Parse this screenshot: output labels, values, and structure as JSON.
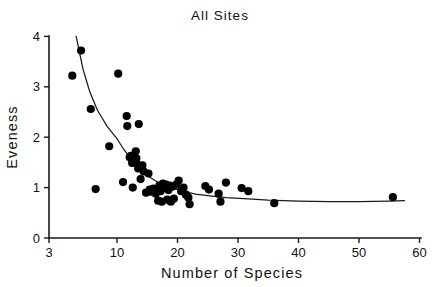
{
  "chart_data": {
    "type": "scatter",
    "title": "All  Sites",
    "xlabel": "Number  of  Species",
    "ylabel": "Eveness",
    "xlim": [
      3,
      60
    ],
    "ylim": [
      0,
      4
    ],
    "grid": false,
    "legend": null,
    "xticks": [
      3,
      10,
      20,
      30,
      40,
      50,
      60
    ],
    "xtick_labels": [
      "3",
      "10",
      "20",
      "30",
      "40",
      "50",
      "60"
    ],
    "yticks": [
      0,
      1,
      2,
      3,
      4
    ],
    "ytick_labels": [
      "0",
      "1",
      "2",
      "3",
      "4"
    ],
    "series": [
      {
        "name": "sites",
        "marker": "filled-circle",
        "color": "#000000",
        "points": [
          [
            5.4,
            3.22
          ],
          [
            6.3,
            3.72
          ],
          [
            7.3,
            2.56
          ],
          [
            7.8,
            0.97
          ],
          [
            9.2,
            1.82
          ],
          [
            10.2,
            3.26
          ],
          [
            11.0,
            1.11
          ],
          [
            11.6,
            2.42
          ],
          [
            11.7,
            2.22
          ],
          [
            12.1,
            1.6
          ],
          [
            12.3,
            1.63
          ],
          [
            12.5,
            1.49
          ],
          [
            12.6,
            1.0
          ],
          [
            12.9,
            1.55
          ],
          [
            13.1,
            1.72
          ],
          [
            13.2,
            1.58
          ],
          [
            13.3,
            1.47
          ],
          [
            13.5,
            1.38
          ],
          [
            13.6,
            2.26
          ],
          [
            13.9,
            1.17
          ],
          [
            14.2,
            1.44
          ],
          [
            14.4,
            1.32
          ],
          [
            14.8,
            0.9
          ],
          [
            15.2,
            1.28
          ],
          [
            15.4,
            0.96
          ],
          [
            15.6,
            0.92
          ],
          [
            16.0,
            0.98
          ],
          [
            16.4,
            0.88
          ],
          [
            16.8,
            0.74
          ],
          [
            17.0,
            1.04
          ],
          [
            17.2,
            0.93
          ],
          [
            17.4,
            0.72
          ],
          [
            17.6,
            1.08
          ],
          [
            17.9,
            1.0
          ],
          [
            18.1,
            1.06
          ],
          [
            18.3,
            0.76
          ],
          [
            18.5,
            0.95
          ],
          [
            18.7,
            1.04
          ],
          [
            18.9,
            0.72
          ],
          [
            19.2,
            1.02
          ],
          [
            19.4,
            0.78
          ],
          [
            19.8,
            1.06
          ],
          [
            20.2,
            1.14
          ],
          [
            20.6,
            0.93
          ],
          [
            21.0,
            1.0
          ],
          [
            21.4,
            0.86
          ],
          [
            21.8,
            0.8
          ],
          [
            22.0,
            0.67
          ],
          [
            24.6,
            1.03
          ],
          [
            25.2,
            0.96
          ],
          [
            26.8,
            0.88
          ],
          [
            27.1,
            0.72
          ],
          [
            28.0,
            1.1
          ],
          [
            30.6,
            0.99
          ],
          [
            31.7,
            0.93
          ],
          [
            36.0,
            0.69
          ],
          [
            55.6,
            0.81
          ]
        ]
      }
    ],
    "fit_curve": {
      "name": "power-law fit",
      "color": "#1a1a1a",
      "points": [
        [
          5.8,
          4.0
        ],
        [
          6.5,
          3.35
        ],
        [
          7.2,
          2.9
        ],
        [
          8.0,
          2.53
        ],
        [
          9.0,
          2.21
        ],
        [
          10.0,
          1.97
        ],
        [
          11.0,
          1.78
        ],
        [
          12.0,
          1.62
        ],
        [
          13.0,
          1.47
        ],
        [
          14.0,
          1.34
        ],
        [
          15.0,
          1.24
        ],
        [
          16.0,
          1.16
        ],
        [
          17.0,
          1.09
        ],
        [
          18.0,
          1.04
        ],
        [
          19.0,
          1.0
        ],
        [
          20.0,
          0.96
        ],
        [
          21.5,
          0.91
        ],
        [
          23.0,
          0.87
        ],
        [
          25.0,
          0.84
        ],
        [
          28.0,
          0.8
        ],
        [
          31.0,
          0.78
        ],
        [
          35.0,
          0.75
        ],
        [
          40.0,
          0.73
        ],
        [
          45.0,
          0.72
        ],
        [
          50.0,
          0.72
        ],
        [
          55.0,
          0.73
        ],
        [
          57.5,
          0.74
        ]
      ]
    }
  },
  "geometry": {
    "x_origin_px": 49,
    "x_break_px": 117,
    "x_break_value": 10,
    "x_px_per_unit": 6.05,
    "y_zero_px": 238,
    "y_px_per_unit": 50.4,
    "point_radius_px": 4.1
  }
}
